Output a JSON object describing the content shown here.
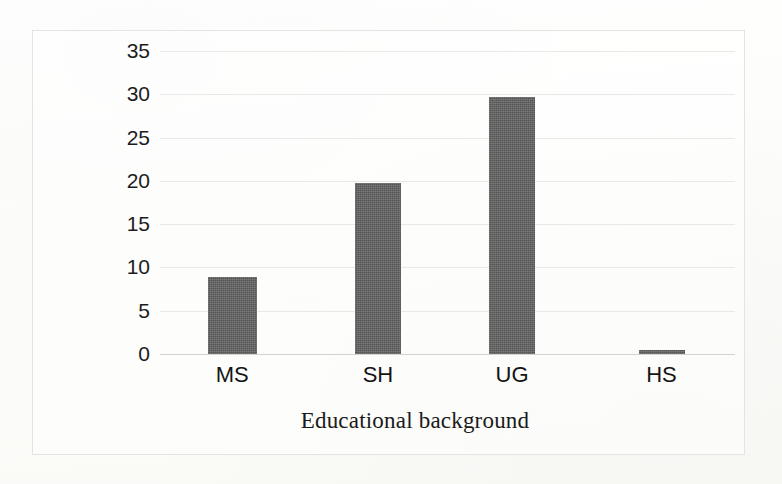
{
  "chart_data": {
    "type": "bar",
    "title": "",
    "xlabel": "Educational background",
    "ylabel": "Number of participants",
    "categories": [
      "MS",
      "SH",
      "UG",
      "HS"
    ],
    "values": [
      8.9,
      19.7,
      29.7,
      0.5
    ],
    "ylim": [
      0,
      35
    ],
    "ytick_labels": [
      "0",
      "5",
      "10",
      "15",
      "20",
      "25",
      "30",
      "35"
    ],
    "ytick_values": [
      0,
      5,
      10,
      15,
      20,
      25,
      30,
      35
    ],
    "grid": true,
    "legend": "none",
    "bar_color": "#5f5f5f",
    "gridline_color": "#e8e8e6",
    "frame_color": "#e4e4e2",
    "background_color": "#fdfdfc",
    "text_color": "#1a1a1a"
  }
}
